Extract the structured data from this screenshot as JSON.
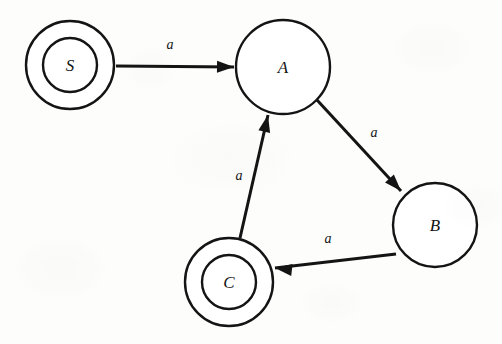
{
  "figure": {
    "kind": "state-transition-diagram",
    "background_color": "#fdfdfc",
    "ink_color": "#141414",
    "width": 502,
    "height": 344
  },
  "chart_data": {
    "type": "diagram",
    "title": "",
    "alphabet": [
      "a"
    ],
    "nodes": [
      {
        "id": "S",
        "label": "S",
        "cx": 70,
        "cy": 65,
        "r_outer": 44,
        "r_inner": 27,
        "double": true,
        "stroke_width": 2.4
      },
      {
        "id": "A",
        "label": "A",
        "cx": 283,
        "cy": 67,
        "r_outer": 47,
        "r_inner": 0,
        "double": false,
        "stroke_width": 2.4
      },
      {
        "id": "B",
        "label": "B",
        "cx": 435,
        "cy": 225,
        "r_outer": 42,
        "r_inner": 0,
        "double": false,
        "stroke_width": 2.4
      },
      {
        "id": "C",
        "label": "C",
        "cx": 229,
        "cy": 282,
        "r_outer": 44,
        "r_inner": 27,
        "double": true,
        "stroke_width": 2.4
      }
    ],
    "edges": [
      {
        "from": "S",
        "to": "A",
        "label": "a",
        "x1": 116,
        "y1": 66,
        "x2": 234,
        "y2": 67,
        "label_x": 170,
        "label_y": 49,
        "width": 3.0
      },
      {
        "from": "A",
        "to": "B",
        "label": "a",
        "x1": 317,
        "y1": 100,
        "x2": 401,
        "y2": 191,
        "label_x": 374,
        "label_y": 137,
        "width": 3.0
      },
      {
        "from": "B",
        "to": "C",
        "label": "a",
        "x1": 396,
        "y1": 254,
        "x2": 275,
        "y2": 268,
        "label_x": 328,
        "label_y": 243,
        "width": 3.0
      },
      {
        "from": "C",
        "to": "A",
        "label": "a",
        "x1": 240,
        "y1": 238,
        "x2": 268,
        "y2": 115,
        "label_x": 239,
        "label_y": 180,
        "width": 3.0
      }
    ],
    "arrowheads": [
      {
        "edge": "S->A",
        "tip_x": 234,
        "tip_y": 67,
        "angle_deg": 0.5,
        "length": 17,
        "half_width": 6
      },
      {
        "edge": "A->B",
        "tip_x": 401,
        "tip_y": 191,
        "angle_deg": 47.3,
        "length": 17,
        "half_width": 6
      },
      {
        "edge": "B->C",
        "tip_x": 275,
        "tip_y": 268,
        "angle_deg": 186.6,
        "length": 17,
        "half_width": 6
      },
      {
        "edge": "C->A",
        "tip_x": 268,
        "tip_y": 115,
        "angle_deg": -77.2,
        "length": 17,
        "half_width": 6
      }
    ],
    "accepting_states": [
      "S",
      "C"
    ],
    "plain_states": [
      "A",
      "B"
    ],
    "grid": false,
    "legend": false
  }
}
